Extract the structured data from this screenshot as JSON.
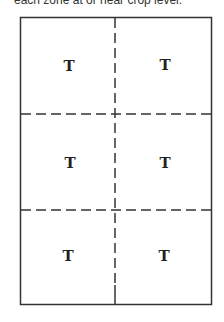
{
  "caption": "each zone at or near crop level.",
  "diagram": {
    "grid": {
      "rows": 3,
      "cols": 2,
      "outer_border": "solid",
      "inner_lines": "dashed"
    },
    "zones": [
      {
        "label": "T"
      },
      {
        "label": "T"
      },
      {
        "label": "T"
      },
      {
        "label": "T"
      },
      {
        "label": "T"
      },
      {
        "label": "T"
      }
    ]
  },
  "colors": {
    "line": "#333333",
    "text": "#222222",
    "background": "#ffffff"
  }
}
